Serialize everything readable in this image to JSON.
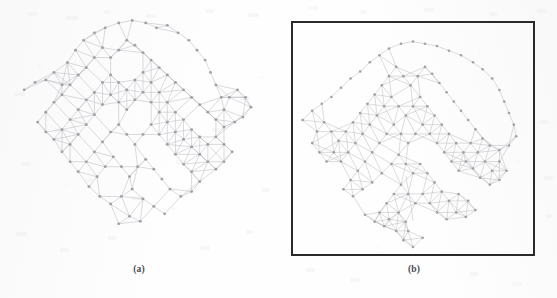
{
  "figure": {
    "background_color": "#fefefe",
    "panels": [
      {
        "id": "a",
        "caption": "(a)",
        "has_border": false,
        "border_color": "",
        "node_color": "#9a9aa0",
        "edge_color": "#b4b4ba",
        "description": "irregular force-directed graph layout, no bounding box"
      },
      {
        "id": "b",
        "caption": "(b)",
        "has_border": true,
        "border_color": "#2a2a2c",
        "node_color": "#9a9aa0",
        "edge_color": "#b4b4ba",
        "description": "graph layout constrained inside a square bounding box"
      }
    ]
  },
  "chart_data": {
    "type": "scatter",
    "title": "",
    "xlabel": "",
    "ylabel": "",
    "grid": false,
    "legend": "none",
    "xlim": [
      0,
      1
    ],
    "ylim": [
      0,
      1
    ],
    "graphs": [
      {
        "panel": "a",
        "layout": "force-directed",
        "node_count": 138,
        "edge_count": 372,
        "nodes": [
          [
            0.06,
            0.33
          ],
          [
            0.1,
            0.3
          ],
          [
            0.14,
            0.29
          ],
          [
            0.17,
            0.26
          ],
          [
            0.2,
            0.31
          ],
          [
            0.22,
            0.22
          ],
          [
            0.25,
            0.17
          ],
          [
            0.28,
            0.13
          ],
          [
            0.32,
            0.1
          ],
          [
            0.36,
            0.08
          ],
          [
            0.41,
            0.06
          ],
          [
            0.46,
            0.05
          ],
          [
            0.51,
            0.06
          ],
          [
            0.55,
            0.08
          ],
          [
            0.59,
            0.07
          ],
          [
            0.63,
            0.1
          ],
          [
            0.67,
            0.13
          ],
          [
            0.7,
            0.17
          ],
          [
            0.73,
            0.21
          ],
          [
            0.75,
            0.26
          ],
          [
            0.77,
            0.31
          ],
          [
            0.79,
            0.36
          ],
          [
            0.8,
            0.41
          ],
          [
            0.82,
            0.36
          ],
          [
            0.85,
            0.33
          ],
          [
            0.88,
            0.36
          ],
          [
            0.9,
            0.4
          ],
          [
            0.87,
            0.44
          ],
          [
            0.84,
            0.46
          ],
          [
            0.8,
            0.48
          ],
          [
            0.77,
            0.45
          ],
          [
            0.74,
            0.42
          ],
          [
            0.71,
            0.39
          ],
          [
            0.68,
            0.36
          ],
          [
            0.65,
            0.33
          ],
          [
            0.62,
            0.3
          ],
          [
            0.59,
            0.27
          ],
          [
            0.56,
            0.24
          ],
          [
            0.53,
            0.21
          ],
          [
            0.5,
            0.18
          ],
          [
            0.47,
            0.15
          ],
          [
            0.44,
            0.13
          ],
          [
            0.41,
            0.17
          ],
          [
            0.38,
            0.2
          ],
          [
            0.35,
            0.16
          ],
          [
            0.32,
            0.2
          ],
          [
            0.29,
            0.24
          ],
          [
            0.26,
            0.27
          ],
          [
            0.23,
            0.31
          ],
          [
            0.2,
            0.35
          ],
          [
            0.17,
            0.38
          ],
          [
            0.14,
            0.42
          ],
          [
            0.11,
            0.46
          ],
          [
            0.14,
            0.5
          ],
          [
            0.17,
            0.53
          ],
          [
            0.2,
            0.49
          ],
          [
            0.23,
            0.45
          ],
          [
            0.26,
            0.41
          ],
          [
            0.29,
            0.37
          ],
          [
            0.32,
            0.34
          ],
          [
            0.35,
            0.3
          ],
          [
            0.38,
            0.27
          ],
          [
            0.41,
            0.3
          ],
          [
            0.44,
            0.33
          ],
          [
            0.47,
            0.29
          ],
          [
            0.5,
            0.26
          ],
          [
            0.53,
            0.3
          ],
          [
            0.56,
            0.34
          ],
          [
            0.59,
            0.38
          ],
          [
            0.62,
            0.42
          ],
          [
            0.65,
            0.45
          ],
          [
            0.68,
            0.49
          ],
          [
            0.71,
            0.52
          ],
          [
            0.74,
            0.55
          ],
          [
            0.77,
            0.52
          ],
          [
            0.8,
            0.55
          ],
          [
            0.83,
            0.58
          ],
          [
            0.8,
            0.62
          ],
          [
            0.77,
            0.65
          ],
          [
            0.74,
            0.62
          ],
          [
            0.71,
            0.59
          ],
          [
            0.68,
            0.56
          ],
          [
            0.65,
            0.53
          ],
          [
            0.62,
            0.5
          ],
          [
            0.59,
            0.46
          ],
          [
            0.56,
            0.42
          ],
          [
            0.53,
            0.38
          ],
          [
            0.5,
            0.34
          ],
          [
            0.47,
            0.37
          ],
          [
            0.44,
            0.41
          ],
          [
            0.41,
            0.38
          ],
          [
            0.38,
            0.35
          ],
          [
            0.35,
            0.39
          ],
          [
            0.32,
            0.43
          ],
          [
            0.29,
            0.47
          ],
          [
            0.26,
            0.51
          ],
          [
            0.23,
            0.55
          ],
          [
            0.2,
            0.58
          ],
          [
            0.23,
            0.62
          ],
          [
            0.26,
            0.66
          ],
          [
            0.29,
            0.62
          ],
          [
            0.32,
            0.58
          ],
          [
            0.35,
            0.54
          ],
          [
            0.38,
            0.5
          ],
          [
            0.41,
            0.47
          ],
          [
            0.44,
            0.51
          ],
          [
            0.47,
            0.55
          ],
          [
            0.5,
            0.51
          ],
          [
            0.53,
            0.47
          ],
          [
            0.56,
            0.51
          ],
          [
            0.59,
            0.55
          ],
          [
            0.62,
            0.59
          ],
          [
            0.65,
            0.63
          ],
          [
            0.68,
            0.66
          ],
          [
            0.71,
            0.7
          ],
          [
            0.68,
            0.74
          ],
          [
            0.64,
            0.76
          ],
          [
            0.6,
            0.73
          ],
          [
            0.57,
            0.69
          ],
          [
            0.54,
            0.65
          ],
          [
            0.51,
            0.61
          ],
          [
            0.48,
            0.64
          ],
          [
            0.45,
            0.68
          ],
          [
            0.42,
            0.64
          ],
          [
            0.39,
            0.6
          ],
          [
            0.36,
            0.64
          ],
          [
            0.33,
            0.68
          ],
          [
            0.3,
            0.72
          ],
          [
            0.34,
            0.76
          ],
          [
            0.38,
            0.79
          ],
          [
            0.42,
            0.76
          ],
          [
            0.46,
            0.73
          ],
          [
            0.5,
            0.77
          ],
          [
            0.54,
            0.8
          ],
          [
            0.58,
            0.83
          ],
          [
            0.49,
            0.86
          ],
          [
            0.45,
            0.84
          ],
          [
            0.41,
            0.87
          ]
        ]
      },
      {
        "panel": "b",
        "layout": "box-constrained",
        "node_count": 140,
        "edge_count": 368,
        "nodes": [
          [
            0.04,
            0.42
          ],
          [
            0.08,
            0.38
          ],
          [
            0.12,
            0.35
          ],
          [
            0.16,
            0.32
          ],
          [
            0.2,
            0.28
          ],
          [
            0.24,
            0.24
          ],
          [
            0.28,
            0.21
          ],
          [
            0.32,
            0.17
          ],
          [
            0.36,
            0.14
          ],
          [
            0.4,
            0.11
          ],
          [
            0.45,
            0.09
          ],
          [
            0.5,
            0.08
          ],
          [
            0.55,
            0.09
          ],
          [
            0.6,
            0.1
          ],
          [
            0.65,
            0.12
          ],
          [
            0.7,
            0.14
          ],
          [
            0.75,
            0.17
          ],
          [
            0.79,
            0.2
          ],
          [
            0.83,
            0.24
          ],
          [
            0.86,
            0.29
          ],
          [
            0.88,
            0.34
          ],
          [
            0.9,
            0.39
          ],
          [
            0.92,
            0.44
          ],
          [
            0.93,
            0.49
          ],
          [
            0.9,
            0.53
          ],
          [
            0.86,
            0.55
          ],
          [
            0.82,
            0.53
          ],
          [
            0.79,
            0.5
          ],
          [
            0.76,
            0.46
          ],
          [
            0.73,
            0.42
          ],
          [
            0.7,
            0.38
          ],
          [
            0.67,
            0.34
          ],
          [
            0.64,
            0.3
          ],
          [
            0.61,
            0.26
          ],
          [
            0.58,
            0.22
          ],
          [
            0.55,
            0.19
          ],
          [
            0.52,
            0.23
          ],
          [
            0.49,
            0.27
          ],
          [
            0.46,
            0.23
          ],
          [
            0.43,
            0.19
          ],
          [
            0.4,
            0.23
          ],
          [
            0.37,
            0.27
          ],
          [
            0.34,
            0.31
          ],
          [
            0.31,
            0.35
          ],
          [
            0.28,
            0.39
          ],
          [
            0.25,
            0.43
          ],
          [
            0.22,
            0.47
          ],
          [
            0.19,
            0.51
          ],
          [
            0.16,
            0.47
          ],
          [
            0.13,
            0.43
          ],
          [
            0.1,
            0.47
          ],
          [
            0.08,
            0.52
          ],
          [
            0.11,
            0.56
          ],
          [
            0.14,
            0.6
          ],
          [
            0.17,
            0.56
          ],
          [
            0.2,
            0.6
          ],
          [
            0.23,
            0.56
          ],
          [
            0.26,
            0.52
          ],
          [
            0.29,
            0.48
          ],
          [
            0.32,
            0.44
          ],
          [
            0.35,
            0.4
          ],
          [
            0.38,
            0.36
          ],
          [
            0.41,
            0.32
          ],
          [
            0.44,
            0.36
          ],
          [
            0.47,
            0.4
          ],
          [
            0.5,
            0.36
          ],
          [
            0.53,
            0.32
          ],
          [
            0.56,
            0.36
          ],
          [
            0.59,
            0.4
          ],
          [
            0.62,
            0.44
          ],
          [
            0.65,
            0.48
          ],
          [
            0.68,
            0.52
          ],
          [
            0.71,
            0.56
          ],
          [
            0.74,
            0.52
          ],
          [
            0.77,
            0.56
          ],
          [
            0.8,
            0.6
          ],
          [
            0.83,
            0.64
          ],
          [
            0.86,
            0.6
          ],
          [
            0.89,
            0.64
          ],
          [
            0.86,
            0.68
          ],
          [
            0.82,
            0.7
          ],
          [
            0.78,
            0.67
          ],
          [
            0.75,
            0.63
          ],
          [
            0.72,
            0.6
          ],
          [
            0.69,
            0.64
          ],
          [
            0.66,
            0.6
          ],
          [
            0.63,
            0.56
          ],
          [
            0.6,
            0.52
          ],
          [
            0.57,
            0.48
          ],
          [
            0.54,
            0.44
          ],
          [
            0.51,
            0.48
          ],
          [
            0.48,
            0.52
          ],
          [
            0.45,
            0.48
          ],
          [
            0.42,
            0.44
          ],
          [
            0.39,
            0.48
          ],
          [
            0.36,
            0.52
          ],
          [
            0.33,
            0.56
          ],
          [
            0.3,
            0.6
          ],
          [
            0.27,
            0.64
          ],
          [
            0.24,
            0.68
          ],
          [
            0.21,
            0.72
          ],
          [
            0.25,
            0.75
          ],
          [
            0.29,
            0.72
          ],
          [
            0.33,
            0.69
          ],
          [
            0.37,
            0.65
          ],
          [
            0.41,
            0.61
          ],
          [
            0.44,
            0.57
          ],
          [
            0.47,
            0.61
          ],
          [
            0.5,
            0.65
          ],
          [
            0.53,
            0.61
          ],
          [
            0.56,
            0.65
          ],
          [
            0.59,
            0.69
          ],
          [
            0.62,
            0.73
          ],
          [
            0.65,
            0.77
          ],
          [
            0.69,
            0.74
          ],
          [
            0.73,
            0.77
          ],
          [
            0.76,
            0.81
          ],
          [
            0.72,
            0.84
          ],
          [
            0.68,
            0.82
          ],
          [
            0.64,
            0.85
          ],
          [
            0.6,
            0.82
          ],
          [
            0.57,
            0.78
          ],
          [
            0.54,
            0.74
          ],
          [
            0.51,
            0.78
          ],
          [
            0.48,
            0.74
          ],
          [
            0.45,
            0.7
          ],
          [
            0.42,
            0.74
          ],
          [
            0.39,
            0.78
          ],
          [
            0.36,
            0.82
          ],
          [
            0.4,
            0.85
          ],
          [
            0.44,
            0.82
          ],
          [
            0.47,
            0.86
          ],
          [
            0.43,
            0.9
          ],
          [
            0.46,
            0.94
          ],
          [
            0.5,
            0.97
          ],
          [
            0.54,
            0.93
          ],
          [
            0.48,
            0.9
          ],
          [
            0.38,
            0.88
          ],
          [
            0.34,
            0.86
          ],
          [
            0.3,
            0.83
          ]
        ]
      }
    ]
  }
}
